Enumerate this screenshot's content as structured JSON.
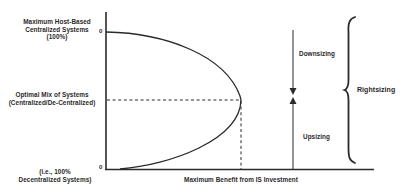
{
  "diagram": {
    "y_axis": {
      "top_label": [
        "Maximum Host-Based",
        "Centralized Systems",
        "(100%)"
      ],
      "middle_label": [
        "Optimal Mix of Systems",
        "(Centralized/De-Centralized)"
      ],
      "bottom_label": [
        "(i.e., 100%",
        "Decentralized Systems)"
      ],
      "top_tick": "0",
      "bottom_tick": "0"
    },
    "x_axis": {
      "label": "Maximum Benefit from IS Investment"
    },
    "arrows": {
      "down_label": "Downsizing",
      "up_label": "Upsizing"
    },
    "brace": {
      "label": "Rightsizing"
    },
    "colors": {
      "ink": "#2a2a2a",
      "background": "#ffffff"
    }
  }
}
